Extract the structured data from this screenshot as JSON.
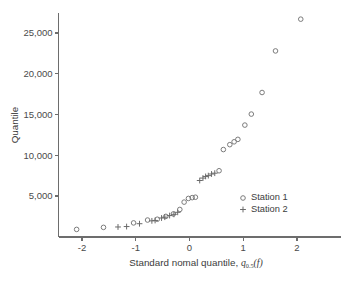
{
  "chart_data": {
    "type": "scatter",
    "title": "",
    "xlabel": "Standard nomal quantile,",
    "xlabel_math": "q",
    "xlabel_math_sub": "0.5",
    "xlabel_math_arg": "(f)",
    "ylabel": "Quantile",
    "xlim": [
      -2.35,
      2.35
    ],
    "ylim": [
      0,
      28000
    ],
    "grid": false,
    "xticks": [
      -2,
      -1,
      0,
      1,
      2
    ],
    "xticklabels": [
      "-2",
      "-1",
      "0",
      "1",
      "2"
    ],
    "yticks": [
      5000,
      10000,
      15000,
      20000,
      25000
    ],
    "yticklabels": [
      "5,000",
      "10,000",
      "15,000",
      "20,000",
      "25,000"
    ],
    "legend_position": "center-right",
    "series": [
      {
        "name": "Station 1",
        "marker": "circle",
        "points": [
          [
            -2.1,
            900
          ],
          [
            -1.6,
            1150
          ],
          [
            -1.04,
            1700
          ],
          [
            -0.78,
            2050
          ],
          [
            -0.6,
            2150
          ],
          [
            -0.44,
            2500
          ],
          [
            -0.3,
            2800
          ],
          [
            -0.18,
            3350
          ],
          [
            -0.1,
            4250
          ],
          [
            -0.02,
            4700
          ],
          [
            0.05,
            4800
          ],
          [
            0.11,
            4850
          ],
          [
            0.55,
            8100
          ],
          [
            0.63,
            10700
          ],
          [
            0.75,
            11300
          ],
          [
            0.83,
            11650
          ],
          [
            0.9,
            11950
          ],
          [
            1.03,
            13700
          ],
          [
            1.15,
            15050
          ],
          [
            1.35,
            17700
          ],
          [
            1.6,
            22800
          ],
          [
            2.07,
            26700
          ]
        ]
      },
      {
        "name": "Station 2",
        "marker": "plus",
        "points": [
          [
            -1.33,
            1200
          ],
          [
            -1.17,
            1250
          ],
          [
            -0.93,
            1600
          ],
          [
            -0.7,
            1950
          ],
          [
            -0.64,
            2000
          ],
          [
            -0.52,
            2300
          ],
          [
            -0.46,
            2400
          ],
          [
            -0.37,
            2600
          ],
          [
            -0.29,
            2750
          ],
          [
            -0.22,
            3000
          ],
          [
            0.19,
            6900
          ],
          [
            0.25,
            7200
          ],
          [
            0.3,
            7400
          ],
          [
            0.35,
            7500
          ],
          [
            0.41,
            7700
          ],
          [
            0.47,
            7800
          ]
        ]
      }
    ]
  },
  "legend": {
    "entries": [
      {
        "label": "Station 1",
        "marker": "circle"
      },
      {
        "label": "Station 2",
        "marker": "plus"
      }
    ]
  }
}
